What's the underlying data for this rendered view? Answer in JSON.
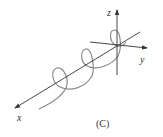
{
  "diagram": {
    "axes": {
      "x_label": "x",
      "y_label": "y",
      "z_label": "z"
    },
    "caption": "(C)",
    "colors": {
      "axis": "#333333",
      "helix": "#8a8a8a",
      "background": "#ffffff"
    }
  }
}
